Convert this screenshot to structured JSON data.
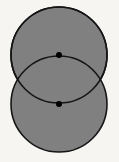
{
  "figure": {
    "canvas": {
      "width": 119,
      "height": 162,
      "background_color": "#f6f5f2"
    },
    "style": {
      "fill_color": "#808080",
      "stroke_color": "#151515",
      "stroke_width": 1.6,
      "dot_color": "#000000",
      "dot_radius": 3
    },
    "shapes": [
      {
        "name": "upper-circle",
        "type": "circle",
        "cx": 59,
        "cy": 55,
        "r": 48
      },
      {
        "name": "lower-circle",
        "type": "circle",
        "cx": 59,
        "cy": 104,
        "r": 48
      }
    ],
    "points": [
      {
        "name": "upper-center-point",
        "type": "dot",
        "cx": 59,
        "cy": 55
      },
      {
        "name": "lower-center-point",
        "type": "dot",
        "cx": 59,
        "cy": 104
      }
    ]
  }
}
